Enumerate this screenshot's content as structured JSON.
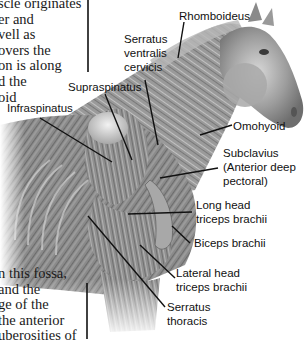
{
  "figure": {
    "text_top_left": [
      "scle originates",
      "er and",
      "vell as",
      "overs the",
      "on is along",
      "d the",
      "oid"
    ],
    "text_bottom_left": [
      "n this fossa,",
      "and the",
      "ge of the",
      "the anterior",
      "uberosities of"
    ],
    "labels": {
      "rhomboideus": [
        "Rhomboideus"
      ],
      "serratus_ventralis_cervicis": [
        "Serratus",
        "ventralis",
        "cervicis"
      ],
      "supraspinatus": [
        "Supraspinatus"
      ],
      "infraspinatus": [
        "Infraspinatus"
      ],
      "omohyoid": [
        "Omohyoid"
      ],
      "subclavius": [
        "Subclavius",
        "(Anterior deep",
        "pectoral)"
      ],
      "long_head_triceps": [
        "Long head",
        "triceps brachii"
      ],
      "biceps_brachii": [
        "Biceps brachii"
      ],
      "lateral_head_triceps": [
        "Lateral head",
        "triceps brachii"
      ],
      "serratus_thoracis": [
        "Serratus",
        "thoracis"
      ]
    },
    "colors": {
      "leader_line": "#111111",
      "muscle_dark": "#5a5a5a",
      "muscle_mid": "#8c8c8c",
      "muscle_light": "#c8c8c8",
      "bone_highlight": "#e6e6e6",
      "background": "#ffffff"
    }
  }
}
